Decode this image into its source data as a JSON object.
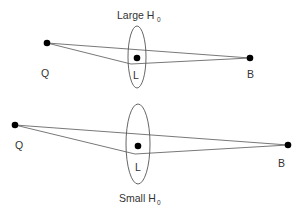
{
  "panels": [
    {
      "title": "Large H",
      "title_sub": "0",
      "labels": {
        "source": "Q",
        "lens": "L",
        "observer": "B"
      },
      "points": {
        "Q": [
          47,
          43
        ],
        "L": [
          137,
          58
        ],
        "B": [
          250,
          58
        ]
      },
      "lens_ellipse": {
        "cx": 137,
        "cy": 57,
        "rx": 9,
        "ry": 31
      },
      "kink": [
        131,
        64
      ]
    },
    {
      "title": "Small H",
      "title_sub": "0",
      "labels": {
        "source": "Q",
        "lens": "L",
        "observer": "B"
      },
      "points": {
        "Q": [
          15,
          125
        ],
        "L": [
          138,
          146
        ],
        "B": [
          288,
          145
        ]
      },
      "lens_ellipse": {
        "cx": 138,
        "cy": 144,
        "rx": 12,
        "ry": 40
      },
      "kink": [
        135,
        154
      ]
    }
  ],
  "colors": {
    "line": "#555555",
    "point": "#000000",
    "text": "#333333"
  }
}
